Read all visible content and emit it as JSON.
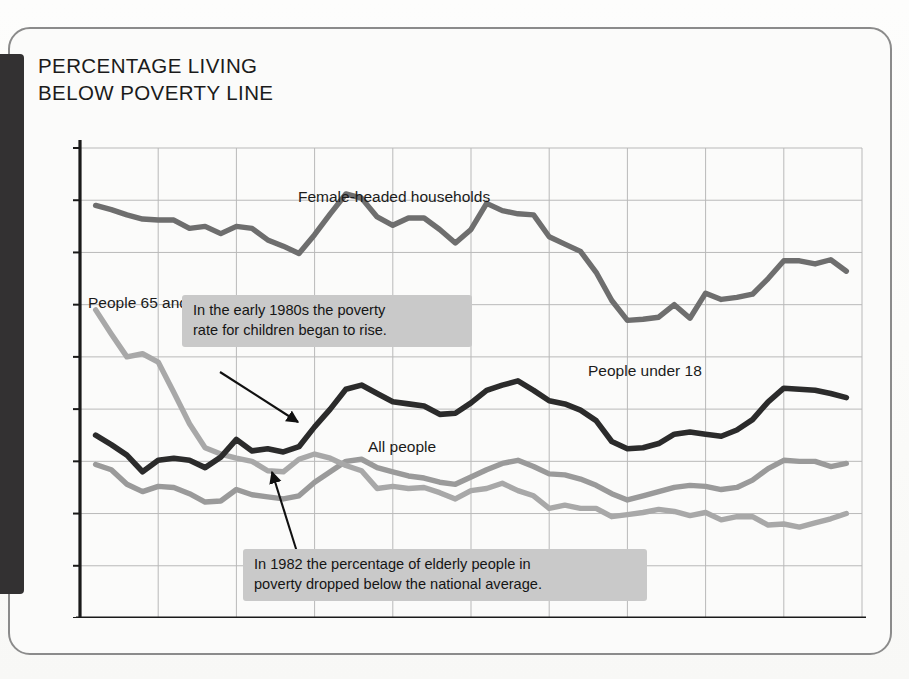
{
  "figure": {
    "title": "PERCENTAGE LIVING\nBELOW POVERTY LINE"
  },
  "annotations": [
    {
      "id": "children",
      "text": "In the early 1980s the poverty\nrate for children began to rise.",
      "points_to_series": "People under 18",
      "points_to_year": 1981
    },
    {
      "id": "elderly",
      "text": "In 1982 the percentage of elderly people in\npoverty dropped below the national average.",
      "points_to_series": "People 65 and older",
      "points_to_year": 1982
    }
  ],
  "series_labels": {
    "female": "Female-headed households",
    "elderly": "People 65 and older",
    "under18": "People under 18",
    "all": "All people"
  },
  "colors": {
    "female": "#6e6e6e",
    "elderly": "#a8a8a8",
    "under18": "#2b2b2b",
    "all": "#9a9a9a",
    "grid": "#b9b9b9",
    "axis": "#1a1a1a",
    "callout_bg": "#c9c9c9",
    "gutter": "#333132"
  },
  "chart_data": {
    "type": "line",
    "title": "PERCENTAGE LIVING BELOW POVERTY LINE",
    "xlabel": "",
    "ylabel": "",
    "xlim": [
      1965,
      2015
    ],
    "ylim": [
      0,
      45
    ],
    "xticks": [
      1965,
      1970,
      1975,
      1980,
      1985,
      1990,
      1995,
      2000,
      2005,
      2010,
      2015
    ],
    "yticks": [
      0,
      5,
      10,
      15,
      20,
      25,
      30,
      35,
      40,
      45
    ],
    "grid": true,
    "legend": "inline-labels",
    "x": [
      1966,
      1967,
      1968,
      1969,
      1970,
      1971,
      1972,
      1973,
      1974,
      1975,
      1976,
      1977,
      1978,
      1979,
      1980,
      1981,
      1982,
      1983,
      1984,
      1985,
      1986,
      1987,
      1988,
      1989,
      1990,
      1991,
      1992,
      1993,
      1994,
      1995,
      1996,
      1997,
      1998,
      1999,
      2000,
      2001,
      2002,
      2003,
      2004,
      2005,
      2006,
      2007,
      2008,
      2009,
      2010,
      2011,
      2012,
      2013,
      2014
    ],
    "series": [
      {
        "name": "Female-headed households",
        "color": "#6e6e6e",
        "values": [
          39.5,
          39.1,
          38.6,
          38.2,
          38.1,
          38.1,
          37.3,
          37.5,
          36.8,
          37.5,
          37.3,
          36.2,
          35.6,
          34.9,
          36.7,
          38.7,
          40.6,
          40.2,
          38.4,
          37.6,
          38.3,
          38.3,
          37.2,
          35.9,
          37.2,
          39.7,
          39.0,
          38.7,
          38.6,
          36.5,
          35.8,
          35.1,
          33.1,
          30.4,
          28.5,
          28.6,
          28.8,
          30.0,
          28.7,
          31.1,
          30.5,
          30.7,
          31.0,
          32.5,
          34.2,
          34.2,
          33.9,
          34.3,
          33.2
        ]
      },
      {
        "name": "People 65 and older",
        "color": "#a8a8a8",
        "values": [
          29.5,
          27.2,
          25.0,
          25.3,
          24.5,
          21.6,
          18.6,
          16.3,
          15.7,
          15.3,
          15.0,
          14.1,
          14.0,
          15.2,
          15.7,
          15.3,
          14.6,
          14.1,
          12.4,
          12.6,
          12.4,
          12.5,
          12.0,
          11.4,
          12.2,
          12.4,
          12.9,
          12.2,
          11.7,
          10.5,
          10.8,
          10.5,
          10.5,
          9.7,
          9.9,
          10.1,
          10.4,
          10.2,
          9.8,
          10.1,
          9.4,
          9.7,
          9.7,
          8.9,
          9.0,
          8.7,
          9.1,
          9.5,
          10.0
        ]
      },
      {
        "name": "People under 18",
        "color": "#2b2b2b",
        "values": [
          17.5,
          16.6,
          15.6,
          14.0,
          15.1,
          15.3,
          15.1,
          14.4,
          15.4,
          17.1,
          16.0,
          16.2,
          15.9,
          16.4,
          18.3,
          20.0,
          21.9,
          22.3,
          21.5,
          20.7,
          20.5,
          20.3,
          19.5,
          19.6,
          20.6,
          21.8,
          22.3,
          22.7,
          21.8,
          20.8,
          20.5,
          19.9,
          18.9,
          16.9,
          16.2,
          16.3,
          16.7,
          17.6,
          17.8,
          17.6,
          17.4,
          18.0,
          19.0,
          20.7,
          22.0,
          21.9,
          21.8,
          21.5,
          21.1
        ]
      },
      {
        "name": "All people",
        "color": "#9a9a9a",
        "values": [
          14.7,
          14.2,
          12.8,
          12.1,
          12.6,
          12.5,
          11.9,
          11.1,
          11.2,
          12.3,
          11.8,
          11.6,
          11.4,
          11.7,
          13.0,
          14.0,
          15.0,
          15.2,
          14.4,
          14.0,
          13.6,
          13.4,
          13.0,
          12.8,
          13.5,
          14.2,
          14.8,
          15.1,
          14.5,
          13.8,
          13.7,
          13.3,
          12.7,
          11.9,
          11.3,
          11.7,
          12.1,
          12.5,
          12.7,
          12.6,
          12.3,
          12.5,
          13.2,
          14.3,
          15.1,
          15.0,
          15.0,
          14.5,
          14.8
        ]
      }
    ]
  }
}
